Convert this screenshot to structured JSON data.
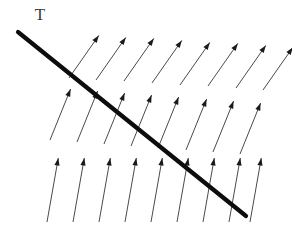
{
  "figure": {
    "width": 292,
    "height": 235,
    "background_color": "#ffffff"
  },
  "labels": [
    {
      "name": "line-label-T",
      "text": "T",
      "x": 40,
      "y": 16,
      "font_size": 17,
      "color": "#3a3a3a"
    }
  ],
  "chart_data": {
    "type": "scatter",
    "xlabel": "",
    "ylabel": "",
    "xlim": [
      0,
      292
    ],
    "ylim": [
      0,
      235
    ],
    "grid": false,
    "legend": null,
    "annotations": [
      {
        "text": "T",
        "x": 40,
        "y": 16,
        "description": "label for the thick oblique discontinuity line"
      }
    ],
    "discontinuity_line": {
      "name": "thick-diagonal-line",
      "label": "T",
      "x1": 18,
      "y1": 32,
      "x2": 246,
      "y2": 216,
      "stroke_width": 4.2,
      "color": "#0d0d0d"
    },
    "vector_color": "#4a4a4a",
    "arrowhead_color": "#1a1a1a",
    "rows": [
      {
        "name": "arrow-row-top",
        "index": 0,
        "angle_deg": 55,
        "length": 52,
        "count": 8,
        "tails": [
          [
            69,
            78
          ],
          [
            96,
            80
          ],
          [
            124,
            81
          ],
          [
            152,
            83
          ],
          [
            180,
            85
          ],
          [
            208,
            86
          ],
          [
            236,
            88
          ],
          [
            263,
            90
          ]
        ]
      },
      {
        "name": "arrow-row-middle",
        "index": 1,
        "angle_deg": 68,
        "length": 55,
        "count": 8,
        "tails": [
          [
            50,
            140
          ],
          [
            77,
            142
          ],
          [
            104,
            144
          ],
          [
            131,
            146
          ],
          [
            158,
            148
          ],
          [
            186,
            150
          ],
          [
            213,
            152
          ],
          [
            240,
            154
          ]
        ]
      },
      {
        "name": "arrow-row-bottom",
        "index": 2,
        "angle_deg": 80,
        "length": 65,
        "count": 9,
        "tails": [
          [
            47,
            222
          ],
          [
            73,
            222
          ],
          [
            99,
            222
          ],
          [
            125,
            222
          ],
          [
            151,
            222
          ],
          [
            177,
            222
          ],
          [
            203,
            222
          ],
          [
            229,
            222
          ],
          [
            250,
            222
          ]
        ]
      }
    ]
  }
}
